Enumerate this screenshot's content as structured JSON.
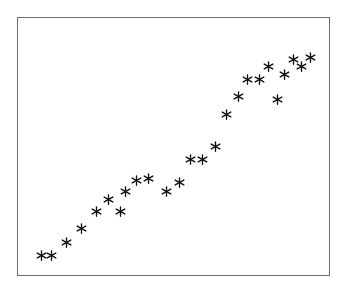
{
  "chart_data": {
    "type": "scatter",
    "title": "",
    "subtitle": "",
    "xlabel": "",
    "ylabel": "",
    "xlim": [
      0,
      100
    ],
    "ylim": [
      0,
      100
    ],
    "grid": false,
    "legend": null,
    "marker": "asterisk",
    "marker_color": "#111111",
    "marker_size_px": 11,
    "frame_color": "#6d6d6d",
    "background_color": "#ffffff",
    "n_points": 25,
    "x_ticks": [],
    "y_ticks": [],
    "annotations": [],
    "points": [
      {
        "x": 4.2,
        "y": 4.2
      },
      {
        "x": 7.7,
        "y": 4.2
      },
      {
        "x": 13.1,
        "y": 10.0
      },
      {
        "x": 18.2,
        "y": 15.8
      },
      {
        "x": 23.3,
        "y": 22.8
      },
      {
        "x": 31.6,
        "y": 22.8
      },
      {
        "x": 27.5,
        "y": 27.8
      },
      {
        "x": 33.5,
        "y": 31.3
      },
      {
        "x": 37.1,
        "y": 35.9
      },
      {
        "x": 41.5,
        "y": 36.7
      },
      {
        "x": 52.1,
        "y": 35.1
      },
      {
        "x": 55.9,
        "y": 44.4
      },
      {
        "x": 60.1,
        "y": 44.4
      },
      {
        "x": 64.5,
        "y": 50.2
      },
      {
        "x": 68.3,
        "y": 63.3
      },
      {
        "x": 72.4,
        "y": 71.0
      },
      {
        "x": 75.6,
        "y": 78.0
      },
      {
        "x": 79.9,
        "y": 78.0
      },
      {
        "x": 83.0,
        "y": 83.4
      },
      {
        "x": 88.3,
        "y": 80.3
      },
      {
        "x": 91.4,
        "y": 86.5
      },
      {
        "x": 94.2,
        "y": 83.4
      },
      {
        "x": 97.4,
        "y": 87.3
      },
      {
        "x": 86.1,
        "y": 69.5
      },
      {
        "x": 47.5,
        "y": 31.3
      }
    ]
  }
}
